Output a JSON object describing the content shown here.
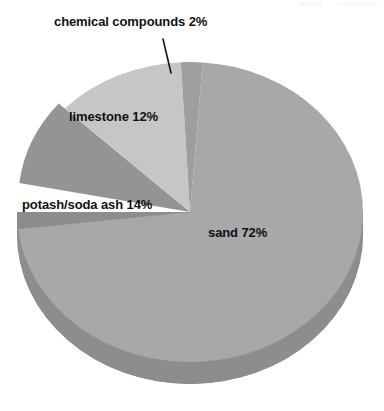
{
  "chart_data": {
    "type": "pie",
    "title": "",
    "subtitle": "",
    "xlabel": "",
    "ylabel": "",
    "legend_position": "none",
    "grid": false,
    "value_unit": "%",
    "categories": [
      "sand",
      "potash/soda ash",
      "limestone",
      "chemical compounds"
    ],
    "values": [
      72,
      14,
      12,
      2
    ],
    "slices": [
      {
        "name": "sand",
        "label": "sand 72%",
        "value": 72,
        "color": "#a8a8a8",
        "label_placement": "inside"
      },
      {
        "name": "potash/soda ash",
        "label": "potash/soda ash 14%",
        "value": 14,
        "color": "#949494",
        "label_placement": "inside"
      },
      {
        "name": "limestone",
        "label": "limestone 12%",
        "value": 12,
        "color": "#c6c6c6",
        "label_placement": "inside"
      },
      {
        "name": "chemical compounds",
        "label": "chemical compounds 2%",
        "value": 2,
        "color": "#9e9e9e",
        "label_placement": "outside-leader"
      }
    ],
    "style": {
      "three_d": true,
      "background": "#ffffff",
      "depth_shadow_color": "#848484",
      "text_color": "#111111"
    }
  },
  "labels": {
    "chemical": "chemical compounds 2%",
    "limestone": "limestone 12%",
    "potash": "potash/soda ash 14%",
    "sand": "sand 72%"
  }
}
